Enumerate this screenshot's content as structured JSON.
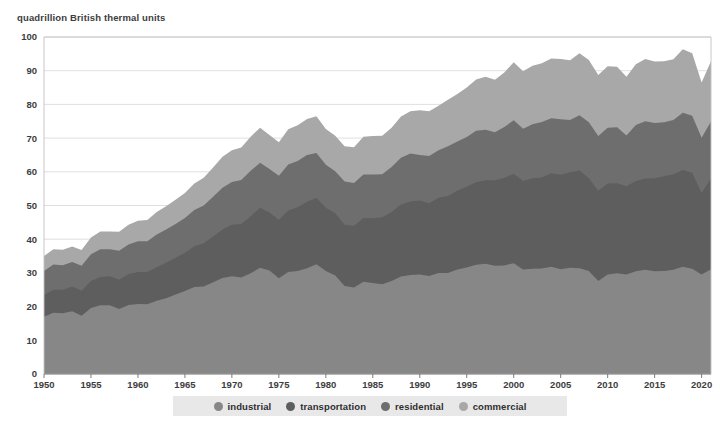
{
  "chart_data": {
    "type": "area",
    "stacked": true,
    "title": "quadrillion British thermal units",
    "xlabel": "",
    "ylabel": "quadrillion British thermal units",
    "xlim": [
      1950,
      2021
    ],
    "ylim": [
      0,
      100
    ],
    "ytick_step": 10,
    "xtick_step": 5,
    "grid": true,
    "legend_position": "bottom",
    "yticks": [
      0,
      10,
      20,
      30,
      40,
      50,
      60,
      70,
      80,
      90,
      100
    ],
    "xticks": [
      1950,
      1955,
      1960,
      1965,
      1970,
      1975,
      1980,
      1985,
      1990,
      1995,
      2000,
      2005,
      2010,
      2015,
      2020
    ],
    "x": [
      1950,
      1951,
      1952,
      1953,
      1954,
      1955,
      1956,
      1957,
      1958,
      1959,
      1960,
      1961,
      1962,
      1963,
      1964,
      1965,
      1966,
      1967,
      1968,
      1969,
      1970,
      1971,
      1972,
      1973,
      1974,
      1975,
      1976,
      1977,
      1978,
      1979,
      1980,
      1981,
      1982,
      1983,
      1984,
      1985,
      1986,
      1987,
      1988,
      1989,
      1990,
      1991,
      1992,
      1993,
      1994,
      1995,
      1996,
      1997,
      1998,
      1999,
      2000,
      2001,
      2002,
      2003,
      2004,
      2005,
      2006,
      2007,
      2008,
      2009,
      2010,
      2011,
      2012,
      2013,
      2014,
      2015,
      2016,
      2017,
      2018,
      2019,
      2020,
      2021
    ],
    "series": [
      {
        "name": "industrial",
        "color": "#878787",
        "values": [
          17.0,
          18.2,
          18.0,
          18.6,
          17.3,
          19.6,
          20.4,
          20.4,
          19.3,
          20.5,
          20.8,
          20.7,
          21.7,
          22.5,
          23.6,
          24.6,
          25.8,
          26.0,
          27.2,
          28.5,
          29.0,
          28.6,
          29.9,
          31.5,
          30.7,
          28.4,
          30.3,
          30.6,
          31.4,
          32.6,
          30.6,
          29.2,
          26.1,
          25.7,
          27.4,
          27.0,
          26.6,
          27.6,
          28.9,
          29.4,
          29.5,
          29.1,
          30.0,
          30.0,
          31.0,
          31.6,
          32.4,
          32.7,
          32.1,
          32.2,
          32.9,
          31.0,
          31.2,
          31.3,
          31.8,
          31.1,
          31.5,
          31.4,
          30.6,
          27.6,
          29.5,
          29.9,
          29.5,
          30.5,
          30.9,
          30.5,
          30.6,
          30.9,
          31.8,
          31.2,
          29.5,
          31.1
        ]
      },
      {
        "name": "transportation",
        "color": "#5e5e5e",
        "values": [
          6.4,
          6.8,
          7.0,
          7.4,
          7.4,
          8.0,
          8.4,
          8.6,
          8.7,
          9.2,
          9.5,
          9.6,
          10.0,
          10.5,
          10.9,
          11.4,
          12.1,
          12.8,
          13.6,
          14.4,
          15.3,
          15.9,
          16.9,
          17.8,
          17.2,
          17.4,
          18.2,
          18.9,
          19.7,
          19.6,
          18.7,
          18.5,
          18.2,
          18.3,
          18.9,
          19.2,
          19.9,
          20.5,
          21.4,
          21.8,
          22.0,
          21.6,
          22.3,
          22.8,
          23.4,
          24.0,
          24.5,
          24.8,
          25.4,
          26.0,
          26.5,
          26.3,
          26.9,
          27.0,
          27.8,
          28.0,
          28.4,
          29.0,
          27.5,
          26.8,
          27.0,
          26.7,
          26.2,
          26.8,
          27.1,
          27.6,
          28.1,
          28.4,
          28.7,
          28.5,
          24.2,
          26.9
        ]
      },
      {
        "name": "residential",
        "color": "#6e6e6e",
        "values": [
          7.2,
          7.5,
          7.3,
          7.2,
          7.4,
          7.9,
          8.2,
          8.0,
          8.6,
          8.7,
          9.1,
          9.1,
          9.7,
          9.9,
          10.0,
          10.3,
          10.8,
          11.2,
          11.8,
          12.4,
          12.7,
          13.1,
          13.5,
          13.4,
          12.9,
          13.0,
          13.7,
          13.7,
          13.9,
          13.4,
          12.8,
          12.5,
          12.8,
          12.7,
          12.9,
          13.0,
          12.8,
          13.3,
          13.9,
          14.2,
          13.5,
          14.0,
          14.1,
          14.8,
          14.6,
          14.7,
          15.3,
          15.0,
          14.2,
          15.1,
          15.9,
          15.5,
          16.0,
          16.5,
          16.3,
          16.5,
          15.5,
          16.4,
          16.6,
          16.2,
          16.6,
          16.6,
          15.1,
          16.6,
          17.0,
          16.4,
          16.0,
          16.1,
          17.0,
          16.9,
          16.4,
          16.9
        ]
      },
      {
        "name": "commercial",
        "color": "#a8a8a8",
        "values": [
          4.4,
          4.5,
          4.6,
          4.6,
          4.7,
          5.0,
          5.3,
          5.3,
          5.6,
          5.9,
          6.1,
          6.3,
          6.7,
          6.9,
          7.2,
          7.4,
          7.8,
          8.2,
          8.7,
          9.2,
          9.4,
          9.6,
          10.1,
          10.4,
          10.1,
          10.0,
          10.4,
          10.6,
          10.7,
          10.9,
          10.6,
          10.5,
          10.5,
          10.6,
          11.2,
          11.4,
          11.4,
          11.7,
          12.2,
          12.6,
          13.3,
          13.3,
          13.2,
          13.8,
          14.1,
          14.7,
          15.2,
          15.7,
          15.6,
          16.2,
          17.2,
          17.0,
          17.4,
          17.4,
          17.7,
          17.9,
          17.7,
          18.4,
          18.5,
          18.1,
          18.2,
          18.0,
          17.4,
          18.0,
          18.5,
          18.2,
          18.1,
          18.0,
          18.9,
          18.6,
          16.4,
          17.9
        ]
      }
    ],
    "legend": [
      {
        "label": "industrial",
        "color": "#878787"
      },
      {
        "label": "transportation",
        "color": "#5e5e5e"
      },
      {
        "label": "residential",
        "color": "#6e6e6e"
      },
      {
        "label": "commercial",
        "color": "#a8a8a8"
      }
    ]
  }
}
